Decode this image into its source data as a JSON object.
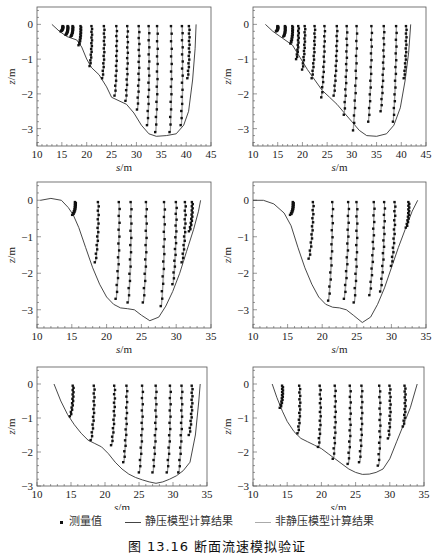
{
  "figure": {
    "caption": "图 13.16  断面流速模拟验证",
    "legend": [
      {
        "label": "测量值",
        "style": "dot",
        "color": "#111111"
      },
      {
        "label": "静压模型计算结果",
        "style": "line",
        "color": "#444444"
      },
      {
        "label": "非静压模型计算结果",
        "style": "line",
        "color": "#aaaaaa"
      }
    ]
  },
  "chart_data": [
    {
      "id": "panel-1",
      "type": "scatter+line",
      "xlabel": "s/m",
      "ylabel": "z/m",
      "xlim": [
        10,
        45
      ],
      "ylim": [
        -3.5,
        0.5
      ],
      "xticks": [
        10,
        15,
        20,
        25,
        30,
        35,
        40,
        45
      ],
      "yticks": [
        0,
        -1,
        -2,
        -3
      ],
      "frame": {
        "x0": 37,
        "y0": 7,
        "x1": 211,
        "y1": 146
      },
      "bed": [
        [
          13,
          0
        ],
        [
          14.5,
          -0.2
        ],
        [
          16,
          -0.35
        ],
        [
          18,
          -0.45
        ],
        [
          19,
          -0.65
        ],
        [
          20,
          -1.0
        ],
        [
          21,
          -1.25
        ],
        [
          22.5,
          -1.45
        ],
        [
          24,
          -1.8
        ],
        [
          25,
          -2.1
        ],
        [
          26.5,
          -2.2
        ],
        [
          28,
          -2.3
        ],
        [
          29.5,
          -2.55
        ],
        [
          31,
          -2.9
        ],
        [
          32.5,
          -3.15
        ],
        [
          34,
          -3.22
        ],
        [
          36,
          -3.2
        ],
        [
          38,
          -3.15
        ],
        [
          39.5,
          -2.9
        ],
        [
          40.5,
          -2.5
        ],
        [
          41.3,
          -1.6
        ],
        [
          41.8,
          -0.7
        ],
        [
          42,
          0
        ]
      ],
      "profiles": [
        {
          "x": 15.2,
          "zb": -0.2,
          "drift": 0.0
        },
        {
          "x": 16.2,
          "zb": -0.3,
          "drift": 0.0
        },
        {
          "x": 17.2,
          "zb": -0.35,
          "drift": 0.0
        },
        {
          "x": 18.8,
          "zb": -0.6,
          "drift": 0.0
        },
        {
          "x": 21.0,
          "zb": -1.2,
          "drift": 0.2
        },
        {
          "x": 23.5,
          "zb": -1.55,
          "drift": 0.3
        },
        {
          "x": 26.0,
          "zb": -2.05,
          "drift": 0.3
        },
        {
          "x": 28.2,
          "zb": -2.2,
          "drift": 0.3
        },
        {
          "x": 30.5,
          "zb": -2.45,
          "drift": 0.5
        },
        {
          "x": 32.5,
          "zb": -2.9,
          "drift": 0.6
        },
        {
          "x": 34.2,
          "zb": -3.1,
          "drift": 0.2
        },
        {
          "x": 37.0,
          "zb": -3.1,
          "drift": 0.9
        },
        {
          "x": 39.2,
          "zb": -2.9,
          "drift": 1.2
        },
        {
          "x": 40.6,
          "zb": -1.55,
          "drift": 0.7
        }
      ]
    },
    {
      "id": "panel-2",
      "type": "scatter+line",
      "xlabel": "s/m",
      "ylabel": "z/m",
      "xlim": [
        10,
        45
      ],
      "ylim": [
        -3.5,
        0.5
      ],
      "xticks": [
        10,
        15,
        20,
        25,
        30,
        35,
        40,
        45
      ],
      "yticks": [
        0,
        -1,
        -2,
        -3
      ],
      "frame": {
        "x0": 253,
        "y0": 7,
        "x1": 426,
        "y1": 146
      },
      "bed": [
        [
          12.5,
          0
        ],
        [
          14,
          -0.2
        ],
        [
          16,
          -0.4
        ],
        [
          18,
          -0.6
        ],
        [
          19.5,
          -0.95
        ],
        [
          21,
          -1.3
        ],
        [
          22.5,
          -1.6
        ],
        [
          24,
          -1.9
        ],
        [
          25.5,
          -2.1
        ],
        [
          27,
          -2.3
        ],
        [
          28.5,
          -2.55
        ],
        [
          30,
          -2.8
        ],
        [
          31.5,
          -3.05
        ],
        [
          33,
          -3.2
        ],
        [
          35,
          -3.22
        ],
        [
          37,
          -3.15
        ],
        [
          38.5,
          -2.9
        ],
        [
          39.8,
          -2.4
        ],
        [
          40.8,
          -1.6
        ],
        [
          41.5,
          -0.8
        ],
        [
          41.9,
          0
        ]
      ],
      "profiles": [
        {
          "x": 15.0,
          "zb": -0.2,
          "drift": 0.8
        },
        {
          "x": 16.5,
          "zb": -0.35,
          "drift": 0.6
        },
        {
          "x": 18.0,
          "zb": -0.55,
          "drift": 0.0
        },
        {
          "x": 19.2,
          "zb": -1.0,
          "drift": -0.3
        },
        {
          "x": 20.5,
          "zb": -1.3,
          "drift": -1.0
        },
        {
          "x": 22.5,
          "zb": -1.55,
          "drift": -1.5
        },
        {
          "x": 24.5,
          "zb": -2.1,
          "drift": -2.0
        },
        {
          "x": 27.0,
          "zb": -2.05,
          "drift": -2.0
        },
        {
          "x": 29.0,
          "zb": -2.6,
          "drift": -1.5
        },
        {
          "x": 31.0,
          "zb": -3.05,
          "drift": -2.6
        },
        {
          "x": 34.0,
          "zb": -2.8,
          "drift": -2.0
        },
        {
          "x": 36.5,
          "zb": -2.5,
          "drift": -2.0
        },
        {
          "x": 39.0,
          "zb": -2.8,
          "drift": -2.0
        },
        {
          "x": 41.0,
          "zb": -1.55,
          "drift": -0.5
        }
      ]
    },
    {
      "id": "panel-3",
      "type": "scatter+line",
      "xlabel": "s/m",
      "ylabel": "z/m",
      "xlim": [
        10,
        35
      ],
      "ylim": [
        -3.5,
        0.5
      ],
      "xticks": [
        10,
        15,
        20,
        25,
        30,
        35
      ],
      "yticks": [
        0,
        -1,
        -2,
        -3
      ],
      "frame": {
        "x0": 37,
        "y0": 182,
        "x1": 211,
        "y1": 328
      },
      "bed": [
        [
          10.5,
          0
        ],
        [
          12,
          0.05
        ],
        [
          13.5,
          0.0
        ],
        [
          14.5,
          -0.2
        ],
        [
          15.2,
          -0.4
        ],
        [
          16,
          -0.75
        ],
        [
          17,
          -1.3
        ],
        [
          18,
          -1.85
        ],
        [
          19,
          -2.3
        ],
        [
          20,
          -2.65
        ],
        [
          21,
          -2.85
        ],
        [
          22,
          -2.95
        ],
        [
          23,
          -2.97
        ],
        [
          24,
          -3.0
        ],
        [
          25,
          -3.15
        ],
        [
          26.2,
          -3.3
        ],
        [
          27.5,
          -3.2
        ],
        [
          28.5,
          -2.9
        ],
        [
          29.5,
          -2.5
        ],
        [
          30.5,
          -2.0
        ],
        [
          31.5,
          -1.4
        ],
        [
          32.5,
          -0.8
        ],
        [
          33.2,
          -0.3
        ],
        [
          33.5,
          0
        ]
      ],
      "profiles": [
        {
          "x": 15.5,
          "zb": -0.4,
          "drift": 0.0
        },
        {
          "x": 18.8,
          "zb": -1.7,
          "drift": -0.4
        },
        {
          "x": 21.8,
          "zb": -2.7,
          "drift": -0.5
        },
        {
          "x": 23.5,
          "zb": -2.8,
          "drift": -0.3
        },
        {
          "x": 25.7,
          "zb": -2.8,
          "drift": -0.4
        },
        {
          "x": 28.3,
          "zb": -2.9,
          "drift": -0.6
        },
        {
          "x": 30.0,
          "zb": -2.3,
          "drift": -0.8
        },
        {
          "x": 31.3,
          "zb": -1.7,
          "drift": -0.6
        },
        {
          "x": 32.3,
          "zb": -0.85,
          "drift": -0.2
        }
      ]
    },
    {
      "id": "panel-4",
      "type": "scatter+line",
      "xlabel": "s/m",
      "ylabel": "z/m",
      "xlim": [
        10,
        35
      ],
      "ylim": [
        -3.5,
        0.5
      ],
      "xticks": [
        10,
        15,
        20,
        25,
        30,
        35
      ],
      "yticks": [
        0,
        -1,
        -2,
        -3
      ],
      "frame": {
        "x0": 253,
        "y0": 182,
        "x1": 426,
        "y1": 328
      },
      "bed": [
        [
          10,
          0
        ],
        [
          11.5,
          0.0
        ],
        [
          13,
          -0.1
        ],
        [
          14.5,
          -0.35
        ],
        [
          15.5,
          -0.7
        ],
        [
          16.5,
          -1.3
        ],
        [
          17.5,
          -1.85
        ],
        [
          18.5,
          -2.3
        ],
        [
          19.5,
          -2.65
        ],
        [
          20.5,
          -2.85
        ],
        [
          21.5,
          -2.93
        ],
        [
          22.5,
          -2.95
        ],
        [
          23.5,
          -3.0
        ],
        [
          24.5,
          -3.15
        ],
        [
          25.8,
          -3.35
        ],
        [
          27,
          -3.2
        ],
        [
          28,
          -2.85
        ],
        [
          29,
          -2.4
        ],
        [
          30,
          -1.85
        ],
        [
          31,
          -1.3
        ],
        [
          32,
          -0.8
        ],
        [
          33,
          -0.3
        ],
        [
          33.8,
          0
        ]
      ],
      "profiles": [
        {
          "x": 15.8,
          "zb": -0.4,
          "drift": 0.0
        },
        {
          "x": 18.7,
          "zb": -1.6,
          "drift": -1.8
        },
        {
          "x": 21.5,
          "zb": -2.75,
          "drift": -1.6
        },
        {
          "x": 23.8,
          "zb": -2.7,
          "drift": -1.8
        },
        {
          "x": 25.0,
          "zb": -2.8,
          "drift": 0.0
        },
        {
          "x": 27.5,
          "zb": -2.6,
          "drift": -2.0
        },
        {
          "x": 29.0,
          "zb": -2.5,
          "drift": -1.5
        },
        {
          "x": 30.5,
          "zb": -1.8,
          "drift": -1.0
        },
        {
          "x": 32.5,
          "zb": -0.75,
          "drift": 0.2
        }
      ]
    },
    {
      "id": "panel-5",
      "type": "scatter+line",
      "xlabel": "s/m",
      "ylabel": "z/m",
      "xlim": [
        10,
        35
      ],
      "ylim": [
        -3.0,
        0.5
      ],
      "xticks": [
        10,
        15,
        20,
        25,
        30,
        35
      ],
      "yticks": [
        0,
        -1,
        -2,
        -3
      ],
      "frame": {
        "x0": 37,
        "y0": 367,
        "x1": 207,
        "y1": 486
      },
      "bed": [
        [
          12.5,
          0
        ],
        [
          13.5,
          -0.5
        ],
        [
          14.5,
          -0.9
        ],
        [
          15.5,
          -1.2
        ],
        [
          16.5,
          -1.45
        ],
        [
          17.5,
          -1.65
        ],
        [
          18.5,
          -1.75
        ],
        [
          19.5,
          -1.85
        ],
        [
          20.5,
          -2.05
        ],
        [
          21.5,
          -2.3
        ],
        [
          22.5,
          -2.5
        ],
        [
          23.5,
          -2.65
        ],
        [
          24.5,
          -2.75
        ],
        [
          25.5,
          -2.82
        ],
        [
          26.5,
          -2.88
        ],
        [
          27.5,
          -2.92
        ],
        [
          28.5,
          -2.88
        ],
        [
          29.5,
          -2.8
        ],
        [
          30.5,
          -2.7
        ],
        [
          31.5,
          -2.55
        ],
        [
          32.5,
          -2.3
        ],
        [
          33.3,
          -1.5
        ],
        [
          33.8,
          -0.5
        ],
        [
          34,
          0
        ]
      ],
      "profiles": [
        {
          "x": 15.3,
          "zb": -0.95,
          "drift": -0.2
        },
        {
          "x": 18.4,
          "zb": -1.65,
          "drift": -0.5
        },
        {
          "x": 21.4,
          "zb": -1.8,
          "drift": -0.5
        },
        {
          "x": 23.2,
          "zb": -2.3,
          "drift": -0.6
        },
        {
          "x": 25.5,
          "zb": -2.6,
          "drift": -0.6
        },
        {
          "x": 27.5,
          "zb": -2.6,
          "drift": -0.6
        },
        {
          "x": 29.6,
          "zb": -2.6,
          "drift": -0.6
        },
        {
          "x": 31.3,
          "zb": -2.6,
          "drift": -0.6
        },
        {
          "x": 32.8,
          "zb": -1.5,
          "drift": -0.3
        }
      ]
    },
    {
      "id": "panel-6",
      "type": "scatter+line",
      "xlabel": "s/m",
      "ylabel": "z/m",
      "xlim": [
        10,
        35
      ],
      "ylim": [
        -3.0,
        0.5
      ],
      "xticks": [
        10,
        15,
        20,
        25,
        30,
        35
      ],
      "yticks": [
        0,
        -1,
        -2,
        -3
      ],
      "frame": {
        "x0": 253,
        "y0": 367,
        "x1": 424,
        "y1": 486
      },
      "bed": [
        [
          12.8,
          0
        ],
        [
          13.5,
          -0.4
        ],
        [
          14.3,
          -0.8
        ],
        [
          15,
          -1.1
        ],
        [
          16,
          -1.4
        ],
        [
          17,
          -1.6
        ],
        [
          18,
          -1.7
        ],
        [
          19,
          -1.8
        ],
        [
          20,
          -1.9
        ],
        [
          21,
          -2.05
        ],
        [
          22,
          -2.2
        ],
        [
          23,
          -2.35
        ],
        [
          24,
          -2.5
        ],
        [
          25,
          -2.6
        ],
        [
          26,
          -2.66
        ],
        [
          27,
          -2.65
        ],
        [
          28,
          -2.6
        ],
        [
          29,
          -2.5
        ],
        [
          30,
          -2.2
        ],
        [
          31,
          -1.7
        ],
        [
          32,
          -1.2
        ],
        [
          33,
          -0.7
        ],
        [
          34,
          0
        ]
      ],
      "profiles": [
        {
          "x": 14.3,
          "zb": -0.7,
          "drift": 0.5
        },
        {
          "x": 16.8,
          "zb": -1.45,
          "drift": 1.2
        },
        {
          "x": 19.8,
          "zb": -1.85,
          "drift": 1.2
        },
        {
          "x": 22.0,
          "zb": -2.2,
          "drift": 0.9
        },
        {
          "x": 24.2,
          "zb": -2.35,
          "drift": 0.7
        },
        {
          "x": 25.9,
          "zb": -2.3,
          "drift": 0.4
        },
        {
          "x": 28.5,
          "zb": -2.4,
          "drift": 1.6
        },
        {
          "x": 30.0,
          "zb": -1.6,
          "drift": 1.4
        },
        {
          "x": 32.2,
          "zb": -1.25,
          "drift": 1.2
        }
      ]
    }
  ]
}
